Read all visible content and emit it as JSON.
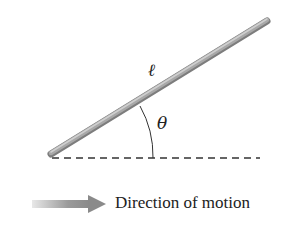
{
  "diagram": {
    "rod_label": "ℓ",
    "angle_label": "θ",
    "motion_label": "Direction of motion",
    "icons": {
      "rod": "inclined-rod",
      "reference_line": "dashed-horizontal-line",
      "angle_arc": "angle-arc",
      "motion_arrow": "right-arrow"
    },
    "colors": {
      "rod": "#9a9a9a",
      "rod_highlight": "#c8c8c8",
      "dash": "#333333",
      "arrow": "#8c8c8c",
      "text": "#222222"
    }
  }
}
